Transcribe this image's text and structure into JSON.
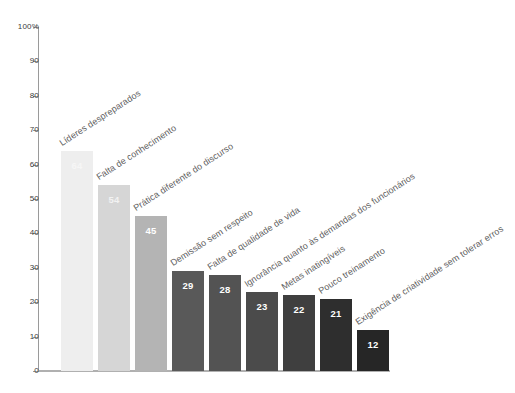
{
  "chart_data": {
    "type": "bar",
    "title": "",
    "subtitle": "",
    "xlabel": "",
    "ylabel": "",
    "ylim": [
      0,
      100
    ],
    "grid": false,
    "legend": "none",
    "orientation": "vertical",
    "y_tick_labels": [
      "100%",
      "90",
      "80",
      "70",
      "60",
      "50",
      "40",
      "30",
      "20",
      "10",
      "0"
    ],
    "y_tick_values": [
      100,
      90,
      80,
      70,
      60,
      50,
      40,
      30,
      20,
      10,
      0
    ],
    "categories": [
      "Líderes despreparados",
      "Falta de conhecimento",
      "Prática diferente do discurso",
      "Demissão sem respeito",
      "Falta de qualidade de vida",
      "Ignorância quanto às demandas dos funcionários",
      "Metas inatingíveis",
      "Pouco treinamento",
      "Exigência de criatividade sem tolerar erros"
    ],
    "values": [
      64,
      54,
      45,
      29,
      28,
      23,
      22,
      21,
      12
    ],
    "value_labels": [
      "64",
      "54",
      "45",
      "29",
      "28",
      "23",
      "22",
      "21",
      "12"
    ],
    "bar_colors": [
      "#eeeeee",
      "#d6d6d6",
      "#b4b4b4",
      "#595959",
      "#535353",
      "#4b4b4b",
      "#3f3f3f",
      "#2e2e2e",
      "#262626"
    ],
    "axis_color": "#9a9a9a",
    "label_color": "#5d5d5d",
    "value_label_color": "#ffffff",
    "background_color": "#ffffff"
  }
}
